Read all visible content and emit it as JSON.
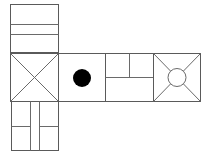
{
  "diagram": {
    "type": "cube-net",
    "colors": {
      "background": "#ffffff",
      "line": "#5a5a5a",
      "dot": "#000000"
    },
    "faces": [
      {
        "id": "top",
        "position": "above first middle face",
        "pattern": "two horizontal lines"
      },
      {
        "id": "middle-1",
        "position": "middle row, column 1",
        "pattern": "X diagonals"
      },
      {
        "id": "middle-2",
        "position": "middle row, column 2",
        "pattern": "filled black dot"
      },
      {
        "id": "middle-3",
        "position": "middle row, column 3",
        "pattern": "T-shaped division"
      },
      {
        "id": "middle-4",
        "position": "middle row, column 4",
        "pattern": "circle with diagonals to corners"
      },
      {
        "id": "bottom",
        "position": "below first middle face",
        "pattern": "two vertical lines with horizontal splits"
      }
    ]
  }
}
